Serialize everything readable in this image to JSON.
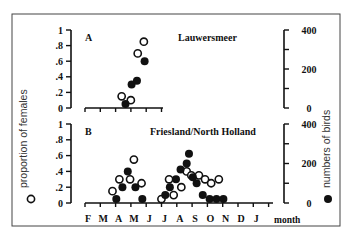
{
  "chart_data": [
    {
      "type": "scatter",
      "panel": "A",
      "title": "Lauwersmeer",
      "xlabel": "month",
      "ylabel_left": "proportion of females",
      "ylabel_right": "numbers of birds",
      "categories": [
        "F",
        "M",
        "A",
        "M",
        "J"
      ],
      "ylim_left": [
        0,
        1
      ],
      "ylim_right": [
        0,
        400
      ],
      "left_ticks": [
        "0",
        ".2",
        ".4",
        ".6",
        ".8",
        "1"
      ],
      "right_ticks": [
        "0",
        "200",
        "400"
      ],
      "series": [
        {
          "name": "proportion of females",
          "marker": "open-circle",
          "axis": "left",
          "points": [
            [
              2.2,
              0.15
            ],
            [
              2.8,
              0.1
            ],
            [
              3.25,
              0.7
            ],
            [
              3.65,
              0.85
            ]
          ]
        },
        {
          "name": "numbers of birds",
          "marker": "filled-circle",
          "axis": "right",
          "points": [
            [
              2.45,
              20
            ],
            [
              2.85,
              120
            ],
            [
              3.2,
              140
            ],
            [
              3.7,
              240
            ]
          ]
        }
      ]
    },
    {
      "type": "scatter",
      "panel": "B",
      "title": "Friesland/North Holland",
      "xlabel": "month",
      "ylabel_left": "proportion of females",
      "ylabel_right": "numbers of birds",
      "categories": [
        "F",
        "M",
        "A",
        "M",
        "J",
        "J",
        "A",
        "S",
        "O",
        "N",
        "D",
        "J"
      ],
      "ylim_left": [
        0,
        1
      ],
      "ylim_right": [
        0,
        400
      ],
      "left_ticks": [
        "0",
        ".2",
        ".4",
        ".6",
        ".8",
        "1"
      ],
      "right_ticks": [
        "0",
        "200",
        "400"
      ],
      "series": [
        {
          "name": "proportion of females",
          "marker": "open-circle",
          "axis": "left",
          "points": [
            [
              1.6,
              0.15
            ],
            [
              2.05,
              0.3
            ],
            [
              2.75,
              0.3
            ],
            [
              3.0,
              0.55
            ],
            [
              3.5,
              0.25
            ],
            [
              4.8,
              0.05
            ],
            [
              5.3,
              0.3
            ],
            [
              5.6,
              0.1
            ],
            [
              6.1,
              0.2
            ],
            [
              6.45,
              0.4
            ],
            [
              6.75,
              0.35
            ],
            [
              7.25,
              0.35
            ],
            [
              7.65,
              0.3
            ],
            [
              8.05,
              0.25
            ],
            [
              8.55,
              0.3
            ]
          ]
        },
        {
          "name": "numbers of birds",
          "marker": "filled-circle",
          "axis": "right",
          "points": [
            [
              1.85,
              20
            ],
            [
              2.25,
              80
            ],
            [
              2.6,
              160
            ],
            [
              3.1,
              80
            ],
            [
              3.55,
              20
            ],
            [
              5.05,
              40
            ],
            [
              5.35,
              80
            ],
            [
              5.75,
              120
            ],
            [
              6.05,
              170
            ],
            [
              6.45,
              200
            ],
            [
              6.6,
              250
            ],
            [
              6.85,
              130
            ],
            [
              7.1,
              100
            ],
            [
              7.5,
              40
            ],
            [
              7.95,
              20
            ],
            [
              8.4,
              20
            ],
            [
              8.85,
              20
            ]
          ]
        }
      ]
    }
  ],
  "panel_a": {
    "letter": "A",
    "site": "Lauwersmeer"
  },
  "panel_b": {
    "letter": "B",
    "site": "Friesland/North Holland"
  },
  "axes": {
    "left_title": "proportion of females",
    "right_title": "numbers of birds",
    "x_title": "month",
    "left_ticks": [
      "1",
      ".8",
      ".6",
      ".4",
      ".2",
      "0"
    ],
    "right_ticks": [
      "400",
      "200",
      "0"
    ],
    "months": [
      "F",
      "M",
      "A",
      "M",
      "J",
      "J",
      "A",
      "S",
      "O",
      "N",
      "D",
      "J"
    ]
  }
}
